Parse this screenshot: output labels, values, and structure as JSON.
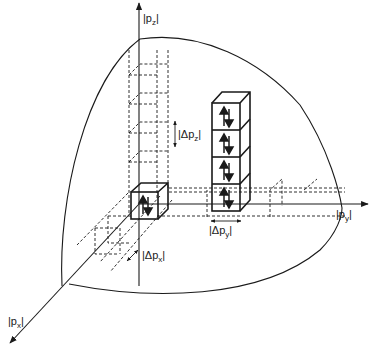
{
  "diagram": {
    "type": "momentum-space phase-space cells (Fermi sphere octant)",
    "axes": {
      "z": {
        "label": "|p",
        "sub": "z",
        "suffix": "|"
      },
      "y": {
        "label": "|p",
        "sub": "y",
        "suffix": "|"
      },
      "x": {
        "label": "|p",
        "sub": "x",
        "suffix": "|"
      }
    },
    "dimension_labels": {
      "dpz": {
        "label": "|Δp",
        "sub": "z",
        "suffix": "|"
      },
      "dpy": {
        "label": "|Δp",
        "sub": "y",
        "suffix": "|"
      },
      "dpx": {
        "label": "|Δp",
        "sub": "x",
        "suffix": "|"
      }
    },
    "cells": {
      "occupied_single": {
        "count": 1,
        "spin_pair": "↑↓"
      },
      "occupied_stack": {
        "count": 4,
        "spin_pair": "↑↓"
      }
    },
    "colors": {
      "ink": "#1a1a1a",
      "background": "#ffffff"
    }
  }
}
